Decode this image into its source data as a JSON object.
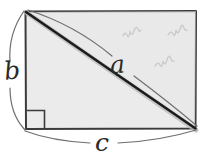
{
  "figure": {
    "background_color": "#ffffff",
    "shape": {
      "name": "rectangle",
      "fill_color": "#ebebeb",
      "stroke_color": "#3b3b3b",
      "left": 25,
      "top": 11,
      "right": 196,
      "bottom": 129,
      "width": 171,
      "height": 118
    },
    "diagonal": {
      "name": "hypotenuse",
      "stroke_color": "#1c1c1c",
      "shadow_color": "#b9b9b9",
      "from_x": 26,
      "from_y": 12,
      "to_x": 195,
      "to_y": 128
    },
    "right_angle_marker": {
      "name": "right-angle-square",
      "corner": "bottom-left",
      "x": 26,
      "y": 110,
      "size": 18,
      "stroke_color": "#3b3b3b"
    },
    "labels": [
      {
        "id": "a",
        "text": "a",
        "meaning": "diagonal-hypotenuse-label",
        "x": 118,
        "y": 73,
        "font_size": 25,
        "rotation": -4
      },
      {
        "id": "b",
        "text": "b",
        "meaning": "left-side-height-label",
        "x": 11,
        "y": 79,
        "font_size": 25,
        "rotation": -6
      },
      {
        "id": "c",
        "text": "c",
        "meaning": "bottom-side-width-label",
        "x": 102,
        "y": 150,
        "font_size": 25,
        "rotation": 0
      }
    ],
    "braces": [
      {
        "id": "brace-a",
        "for_label": "a",
        "orientation": "along-diagonal",
        "stroke_color": "#777777"
      },
      {
        "id": "brace-b",
        "for_label": "b",
        "orientation": "left-vertical",
        "stroke_color": "#777777"
      },
      {
        "id": "brace-c",
        "for_label": "c",
        "orientation": "bottom-horizontal",
        "stroke_color": "#777777"
      }
    ],
    "scribbles": [
      {
        "id": "scribble-1",
        "x": 130,
        "y": 33,
        "color": "#c9c9c9"
      },
      {
        "id": "scribble-2",
        "x": 175,
        "y": 32,
        "color": "#c9c9c9"
      },
      {
        "id": "scribble-3",
        "x": 162,
        "y": 63,
        "color": "#c9c9c9"
      }
    ]
  }
}
